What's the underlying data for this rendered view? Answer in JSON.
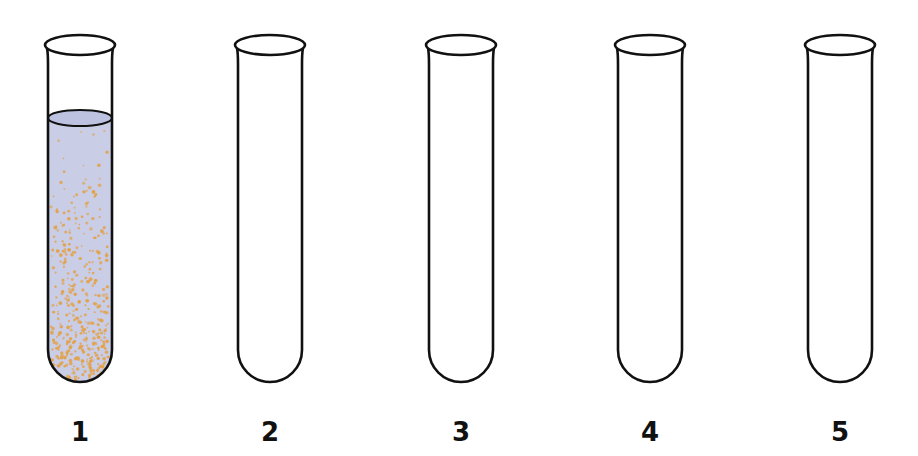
{
  "diagram": {
    "type": "test-tube-series",
    "tube_count": 5,
    "colors": {
      "outline": "#111111",
      "liquid": "#c9cde6",
      "liquid_surface": "#bcc2e0",
      "particles": "#e3a24a",
      "background": "#ffffff"
    },
    "tubes": [
      {
        "label": "1",
        "center_x": 80,
        "filled": true,
        "contents": "bluish liquid with suspended orange particles, denser toward bottom"
      },
      {
        "label": "2",
        "center_x": 270,
        "filled": false,
        "contents": "empty"
      },
      {
        "label": "3",
        "center_x": 461,
        "filled": false,
        "contents": "empty"
      },
      {
        "label": "4",
        "center_x": 650,
        "filled": false,
        "contents": "empty"
      },
      {
        "label": "5",
        "center_x": 840,
        "filled": false,
        "contents": "empty"
      }
    ]
  }
}
